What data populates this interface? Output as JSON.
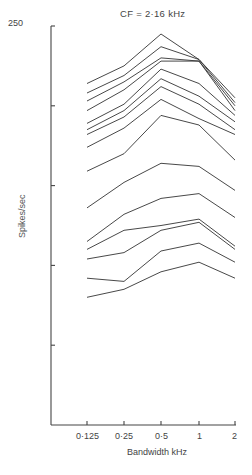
{
  "chart_data": {
    "type": "line",
    "title": "CF = 2·16  kHz",
    "xlabel": "Bandwidth  kHz",
    "ylabel": "Spikes/sec",
    "x": [
      0.125,
      0.25,
      0.5,
      1,
      2
    ],
    "x_tick_labels": [
      "0·125",
      "0·25",
      "0·5",
      "1",
      "2"
    ],
    "x_scale": "log2",
    "y_tick_labels": [
      "250"
    ],
    "y_ticks": [
      0,
      50,
      100,
      150,
      200,
      250
    ],
    "ylim": [
      0,
      250
    ],
    "grid": false,
    "legend": "none",
    "line_color": "#333333",
    "series": [
      {
        "name": "curve-1",
        "values": [
          214,
          225,
          245,
          229,
          205
        ]
      },
      {
        "name": "curve-2",
        "values": [
          208,
          219,
          237,
          229,
          202
        ]
      },
      {
        "name": "curve-3",
        "values": [
          203,
          215,
          230,
          228,
          200
        ]
      },
      {
        "name": "curve-4",
        "values": [
          197,
          210,
          228,
          228,
          197
        ]
      },
      {
        "name": "curve-5",
        "values": [
          189,
          201,
          223,
          214,
          194
        ]
      },
      {
        "name": "curve-6",
        "values": [
          185,
          197,
          217,
          206,
          190
        ]
      },
      {
        "name": "curve-7",
        "values": [
          182,
          193,
          212,
          201,
          185
        ]
      },
      {
        "name": "curve-8",
        "values": [
          174,
          186,
          204,
          192,
          182
        ]
      },
      {
        "name": "curve-9",
        "values": [
          159,
          170,
          194,
          188,
          166
        ]
      },
      {
        "name": "curve-10",
        "values": [
          136,
          152,
          164,
          162,
          147
        ]
      },
      {
        "name": "curve-11",
        "values": [
          115,
          132,
          142,
          145,
          130
        ]
      },
      {
        "name": "curve-12",
        "values": [
          110,
          122,
          125,
          129,
          112
        ]
      },
      {
        "name": "curve-13",
        "values": [
          104,
          108,
          122,
          127,
          110
        ]
      },
      {
        "name": "curve-14",
        "values": [
          92,
          90,
          109,
          114,
          102
        ]
      },
      {
        "name": "curve-15",
        "values": [
          80,
          85,
          96,
          102,
          92
        ]
      }
    ]
  }
}
